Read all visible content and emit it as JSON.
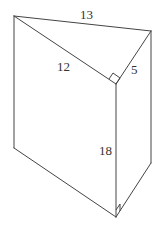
{
  "diagram": {
    "type": "triangular-prism",
    "colors": {
      "line": "#444444",
      "text": "#333333",
      "background": "#ffffff"
    },
    "vertices": {
      "top_left": [
        14,
        16
      ],
      "top_right": [
        151,
        31
      ],
      "top_mid": [
        116,
        84
      ],
      "bottom_left": [
        14,
        148
      ],
      "bottom_right": [
        151,
        163
      ],
      "bottom_mid": [
        116,
        217
      ]
    },
    "labels": {
      "hypotenuse": "13",
      "leg_long": "12",
      "leg_short": "5",
      "height": "18"
    },
    "right_angle_marks": [
      "top_mid",
      "bottom_mid"
    ]
  }
}
